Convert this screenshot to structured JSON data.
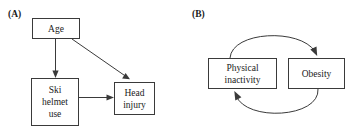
{
  "figure": {
    "background_color": "#ffffff",
    "stroke_color": "#3a3a3a",
    "text_color": "#1a1a1a"
  },
  "panels": [
    {
      "id": "a",
      "label": "(A)",
      "nodes": [
        {
          "id": "age",
          "label": "Age"
        },
        {
          "id": "ski-helmet",
          "label": "Ski helmet use"
        },
        {
          "id": "head-injury",
          "label": "Head injury"
        }
      ],
      "edges": [
        {
          "id": "age-to-ski-helmet",
          "from": "Age",
          "to": "Ski helmet use",
          "style": "straight"
        },
        {
          "id": "age-to-head-injury",
          "from": "Age",
          "to": "Head injury",
          "style": "straight"
        },
        {
          "id": "ski-helmet-to-head-injury",
          "from": "Ski helmet use",
          "to": "Head injury",
          "style": "straight"
        }
      ]
    },
    {
      "id": "b",
      "label": "(B)",
      "nodes": [
        {
          "id": "physical-inactivity",
          "label": "Physical inactivity"
        },
        {
          "id": "obesity",
          "label": "Obesity"
        }
      ],
      "edges": [
        {
          "id": "physical-inactivity-to-obesity",
          "from": "Physical inactivity",
          "to": "Obesity",
          "style": "curved-top"
        },
        {
          "id": "obesity-to-physical-inactivity",
          "from": "Obesity",
          "to": "Physical inactivity",
          "style": "curved-bottom"
        }
      ]
    }
  ],
  "node_labels": {
    "age": "Age",
    "ski_helmet_line1": "Ski",
    "ski_helmet_line2": "helmet",
    "ski_helmet_line3": "use",
    "head_injury_line1": "Head",
    "head_injury_line2": "injury",
    "physical_inactivity_line1": "Physical",
    "physical_inactivity_line2": "inactivity",
    "obesity": "Obesity"
  },
  "panel_labels": {
    "a": "(A)",
    "b": "(B)"
  }
}
